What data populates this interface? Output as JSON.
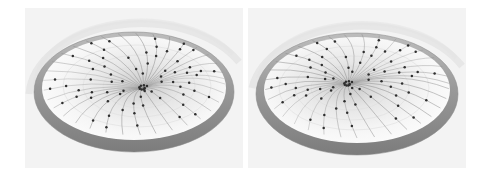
{
  "figure": {
    "panel_count": 2,
    "background_color": "#ffffff",
    "panel_background_color": "#f3f3f3",
    "width_px": 488,
    "height_px": 180
  },
  "palette": {
    "rim_dark": "#7f7f7f",
    "rim_mid": "#9a9a9a",
    "rim_light": "#bdbdbd",
    "bowl_surface": "#f0f0f0",
    "bowl_shade": "#d8d8d8",
    "edge_line": "#8d8d8d",
    "node_dot": "#2e2e2e",
    "halo_arc": "#e2e2e2",
    "panel_bg": "#f3f3f3",
    "page_bg": "#ffffff"
  },
  "panels": [
    {
      "id": "panel-left",
      "label": "Left view",
      "hub": {
        "cx": 118,
        "cy": 80,
        "label": "central hub"
      },
      "rim": {
        "cx": 109,
        "cy": 80,
        "rx": 100,
        "ry": 60,
        "thickness": 9
      },
      "spokes": 34,
      "nodes_visible": 62,
      "halo": true
    },
    {
      "id": "panel-right",
      "label": "Right view",
      "hub": {
        "cx": 100,
        "cy": 76,
        "label": "central hub"
      },
      "rim": {
        "cx": 109,
        "cy": 82,
        "rx": 101,
        "ry": 61,
        "thickness": 9
      },
      "spokes": 34,
      "nodes_visible": 68,
      "halo": true
    }
  ],
  "chart_data": {
    "type": "scatter",
    "subtitle": "",
    "xlabel": "",
    "ylabel": "",
    "legend": [],
    "grid": false,
    "series": [
      {
        "name": "left-panel-edges",
        "kind": "geodesic-curves",
        "count": 34,
        "angles_deg": [
          0,
          10,
          21,
          32,
          43,
          54,
          65,
          76,
          86,
          97,
          108,
          119,
          130,
          141,
          152,
          162,
          173,
          184,
          195,
          206,
          217,
          228,
          238,
          249,
          260,
          271,
          282,
          293,
          304,
          314,
          325,
          336,
          347,
          354
        ]
      },
      {
        "name": "left-panel-nodes",
        "kind": "points",
        "count": 62,
        "radial_fractions": [
          0.22,
          0.31,
          0.38,
          0.45,
          0.52,
          0.58,
          0.64,
          0.7,
          0.76,
          0.82,
          0.88,
          0.93
        ]
      },
      {
        "name": "right-panel-edges",
        "kind": "geodesic-curves",
        "count": 34,
        "angles_deg": [
          3,
          14,
          25,
          36,
          46,
          57,
          68,
          79,
          90,
          100,
          111,
          122,
          133,
          144,
          154,
          165,
          176,
          187,
          198,
          208,
          219,
          230,
          241,
          252,
          262,
          273,
          284,
          295,
          306,
          316,
          327,
          338,
          349,
          357
        ]
      },
      {
        "name": "right-panel-nodes",
        "kind": "points",
        "count": 68,
        "radial_fractions": [
          0.2,
          0.28,
          0.35,
          0.42,
          0.49,
          0.56,
          0.62,
          0.68,
          0.74,
          0.8,
          0.86,
          0.92
        ]
      }
    ]
  }
}
